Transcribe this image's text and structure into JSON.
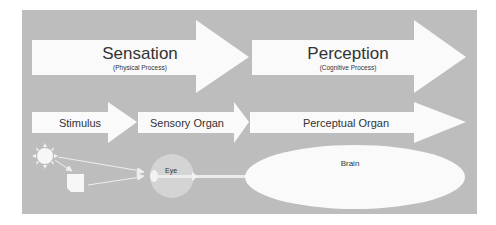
{
  "colors": {
    "panel": "#bdbdbd",
    "shape": "#fafafa",
    "eye": "#d6d6d6",
    "text": "#333333"
  },
  "top_row": [
    {
      "title": "Sensation",
      "subtitle": "(Physical Process)"
    },
    {
      "title": "Perception",
      "subtitle": "(Cognitive Process)"
    }
  ],
  "middle_row": [
    {
      "label": "Stimulus"
    },
    {
      "label": "Sensory Organ"
    },
    {
      "label": "Perceptual Organ"
    }
  ],
  "bottom_row": {
    "eye_label": "Eye",
    "brain_label": "Brain",
    "light_source_icon": "sun-icon",
    "object_icon": "square-object-icon"
  }
}
